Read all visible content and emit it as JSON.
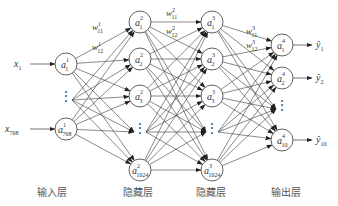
{
  "diagram": {
    "type": "fully-connected neural network",
    "colors": {
      "stroke": "#3a3a3a",
      "node_fill": "#ffffff",
      "text": "#333333",
      "label": "#555555"
    },
    "layers": [
      {
        "name": "输入层",
        "x": 66,
        "nodes": [
          {
            "sup": "1",
            "sub": "1",
            "y": 64
          },
          {
            "ellipsis": true,
            "y": 100
          },
          {
            "sup": "1",
            "sub": "768",
            "y": 129
          }
        ]
      },
      {
        "name": "隐藏层",
        "x": 140,
        "nodes": [
          {
            "sup": "2",
            "sub": "1",
            "y": 22
          },
          {
            "sup": "2",
            "sub": "2",
            "y": 59
          },
          {
            "sup": "2",
            "sub": "3",
            "y": 96
          },
          {
            "ellipsis": true,
            "y": 132
          },
          {
            "sup": "2",
            "sub": "1024",
            "y": 170
          }
        ]
      },
      {
        "name": "隐藏层",
        "x": 212,
        "nodes": [
          {
            "sup": "3",
            "sub": "1",
            "y": 22
          },
          {
            "sup": "3",
            "sub": "2",
            "y": 59
          },
          {
            "sup": "3",
            "sub": "3",
            "y": 96
          },
          {
            "ellipsis": true,
            "y": 132
          },
          {
            "sup": "3",
            "sub": "1024",
            "y": 170
          }
        ]
      },
      {
        "name": "输出层",
        "x": 282,
        "nodes": [
          {
            "sup": "4",
            "sub": "1",
            "y": 45
          },
          {
            "sup": "4",
            "sub": "2",
            "y": 78
          },
          {
            "ellipsis": true,
            "y": 109
          },
          {
            "sup": "4",
            "sub": "10",
            "y": 140
          }
        ]
      }
    ],
    "inputs": [
      {
        "label": "x",
        "sub": "1",
        "y": 64
      },
      {
        "label": "x",
        "sub": "768",
        "y": 129
      }
    ],
    "outputs": [
      {
        "label": "ŷ",
        "sub": "1",
        "y": 45
      },
      {
        "label": "ŷ",
        "sub": "2",
        "y": 78
      },
      {
        "label": "ŷ",
        "sub": "10",
        "y": 140
      }
    ],
    "weight_labels": [
      {
        "text": "w",
        "sup": "1",
        "sub": "11",
        "x": 92,
        "y": 30
      },
      {
        "text": "w",
        "sup": "1",
        "sub": "12",
        "x": 92,
        "y": 50
      },
      {
        "text": "w",
        "sup": "2",
        "sub": "11",
        "x": 166,
        "y": 16
      },
      {
        "text": "w",
        "sup": "2",
        "sub": "12",
        "x": 166,
        "y": 34
      },
      {
        "text": "w",
        "sup": "3",
        "sub": "11",
        "x": 246,
        "y": 34
      },
      {
        "text": "w",
        "sup": "3",
        "sub": "12",
        "x": 246,
        "y": 48
      }
    ],
    "layer_labels": [
      {
        "text": "输入层",
        "x": 52,
        "y": 184
      },
      {
        "text": "隐藏层",
        "x": 138,
        "y": 184
      },
      {
        "text": "隐藏层",
        "x": 211,
        "y": 184
      },
      {
        "text": "输出层",
        "x": 286,
        "y": 184
      }
    ]
  }
}
